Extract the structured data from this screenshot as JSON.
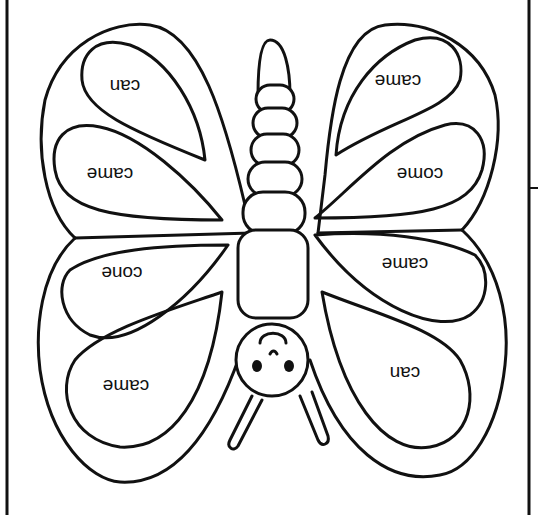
{
  "worksheet": {
    "title": "Butterfly word coloring sheet",
    "orientation": "upside-down",
    "ink_color": "#111111",
    "paper_color": "#ffffff",
    "wings": {
      "upper_left": {
        "outer_label": "can",
        "inner_label": "came"
      },
      "upper_right": {
        "outer_label": "came",
        "inner_label": "come"
      },
      "lower_left": {
        "outer_label": "cone",
        "inner_label": "came"
      },
      "lower_right": {
        "outer_label": "came",
        "inner_label": "can"
      }
    },
    "words": [
      "can",
      "came",
      "came",
      "come",
      "cone",
      "came",
      "came",
      "can"
    ],
    "body": {
      "segments": 6,
      "has_face": true,
      "antennae": 2
    }
  }
}
